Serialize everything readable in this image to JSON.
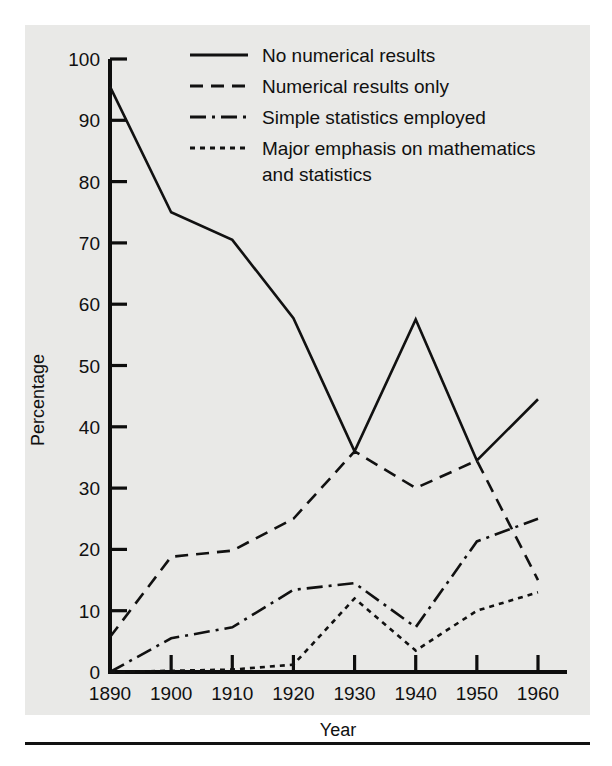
{
  "chart_data": {
    "type": "line",
    "title": "",
    "xlabel": "Year",
    "ylabel": "Percentage",
    "x": [
      1890,
      1900,
      1910,
      1920,
      1930,
      1940,
      1950,
      1960
    ],
    "xticklabels": [
      "1890",
      "1900",
      "1910",
      "1920",
      "1930",
      "1940",
      "1950",
      "1960"
    ],
    "yticklabels": [
      "0",
      "10",
      "20",
      "30",
      "40",
      "50",
      "60",
      "70",
      "80",
      "90",
      "100"
    ],
    "yticks": [
      0,
      10,
      20,
      30,
      40,
      50,
      60,
      70,
      80,
      90,
      100
    ],
    "xlim": [
      1885,
      1965
    ],
    "ylim": [
      0,
      100
    ],
    "grid": false,
    "legend_position": "top-right-inside",
    "series": [
      {
        "name": "No numerical results",
        "style": "solid",
        "values": [
          95.5,
          75.0,
          70.5,
          57.7,
          36.0,
          57.5,
          34.5,
          44.5
        ]
      },
      {
        "name": "Numerical results only",
        "style": "dashed",
        "values": [
          5.7,
          18.8,
          19.8,
          25.0,
          36.0,
          30.0,
          34.5,
          15.0
        ]
      },
      {
        "name": "Simple statistics employed",
        "style": "dash-dot",
        "values": [
          0.0,
          5.5,
          7.3,
          13.4,
          14.5,
          7.3,
          21.3,
          25.0
        ]
      },
      {
        "name": "Major emphasis on mathematics and statistics",
        "style": "dotted",
        "values": [
          0.0,
          0.2,
          0.4,
          1.2,
          12.0,
          3.5,
          10.0,
          13.0
        ]
      }
    ]
  },
  "legend": {
    "entries": [
      {
        "label": "No numerical results",
        "style": "solid"
      },
      {
        "label": "Numerical results only",
        "style": "dashed"
      },
      {
        "label": "Simple statistics employed",
        "style": "dash-dot"
      },
      {
        "label": "Major emphasis on mathematics",
        "label2": "and statistics",
        "style": "dotted"
      }
    ]
  },
  "axes": {
    "y_axis_title": "Percentage",
    "x_axis_title": "Year"
  },
  "colors": {
    "ink": "#111111",
    "panel_background": "#e9e9e7",
    "page_background": "#ffffff"
  }
}
